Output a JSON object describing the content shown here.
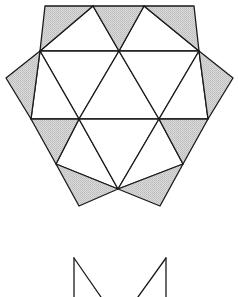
{
  "figure": {
    "colors": {
      "stroke": "#1a1a1a",
      "shade": "#cfcfcf",
      "background": "#ffffff"
    },
    "vertices": {
      "A": [
        45,
        6
      ],
      "B": [
        93,
        6
      ],
      "C": [
        144,
        6
      ],
      "D": [
        194,
        6
      ],
      "E": [
        40,
        51
      ],
      "F": [
        119,
        51
      ],
      "G": [
        199,
        51
      ],
      "L": [
        6,
        78
      ],
      "R": [
        233,
        78
      ],
      "H": [
        31,
        119
      ],
      "I": [
        79,
        119
      ],
      "J": [
        159,
        119
      ],
      "K": [
        208,
        119
      ],
      "M": [
        56,
        164
      ],
      "N": [
        183,
        164
      ],
      "O": [
        118,
        189
      ],
      "P": [
        79,
        206
      ],
      "Q": [
        160,
        206
      ]
    },
    "shaded_triangles": [
      [
        "A",
        "B",
        "E"
      ],
      [
        "B",
        "C",
        "F"
      ],
      [
        "C",
        "D",
        "G"
      ],
      [
        "L",
        "E",
        "H"
      ],
      [
        "R",
        "G",
        "K"
      ],
      [
        "H",
        "I",
        "M"
      ],
      [
        "J",
        "K",
        "N"
      ],
      [
        "M",
        "O",
        "P"
      ],
      [
        "N",
        "O",
        "Q"
      ]
    ],
    "white_triangles": [
      [
        "B",
        "E",
        "F"
      ],
      [
        "C",
        "F",
        "G"
      ],
      [
        "E",
        "F",
        "I"
      ],
      [
        "F",
        "I",
        "J"
      ],
      [
        "F",
        "G",
        "J"
      ],
      [
        "E",
        "H",
        "I"
      ],
      [
        "G",
        "J",
        "K"
      ],
      [
        "I",
        "M",
        "O"
      ],
      [
        "I",
        "J",
        "O"
      ],
      [
        "J",
        "N",
        "O"
      ]
    ],
    "partial_figure": {
      "left_vertical": [
        [
          74,
          258
        ],
        [
          74,
          297
        ]
      ],
      "left_diagonal": [
        [
          74,
          258
        ],
        [
          101,
          297
        ]
      ],
      "right_vertical": [
        [
          166,
          258
        ],
        [
          166,
          297
        ]
      ],
      "right_diagonal": [
        [
          166,
          258
        ],
        [
          138,
          297
        ]
      ]
    }
  }
}
